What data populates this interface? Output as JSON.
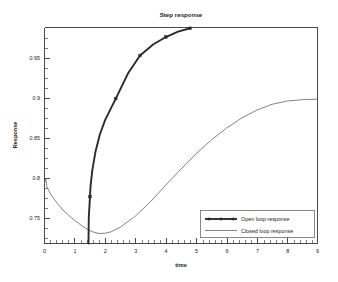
{
  "chart_data": {
    "type": "line",
    "title": "Step response",
    "xlabel": "time",
    "ylabel": "Response",
    "xlim": [
      0,
      9
    ],
    "ylim": [
      0.7194,
      0.9894
    ],
    "grid": false,
    "legend_position": "bottom-right",
    "x_ticks": [
      0,
      1,
      2,
      3,
      4,
      5,
      6,
      7,
      8,
      9
    ],
    "x_tick_labels": [
      "0",
      "1",
      "2",
      "3",
      "4",
      "5",
      "6",
      "7",
      "8",
      "9"
    ],
    "x_minor_tick_step": 0.2,
    "y_ticks": [
      0.75,
      0.8,
      0.85,
      0.9,
      0.95
    ],
    "y_tick_labels": [
      "0.75",
      "0.8",
      "0.85",
      "0.9",
      "0.95"
    ],
    "y_minor_tick_step": 0.0125,
    "series": [
      {
        "name": "Open loop response",
        "style": "line-with-square-markers",
        "color": "#2b2b2b",
        "markers": true,
        "x": [
          1.45,
          1.46,
          1.5,
          1.52,
          1.58,
          1.68,
          1.82,
          2.0,
          2.35,
          2.75,
          3.15,
          3.58,
          4.0,
          4.4,
          4.8
        ],
        "y": [
          0.7194,
          0.752,
          0.778,
          0.792,
          0.812,
          0.834,
          0.855,
          0.874,
          0.9005,
          0.9318,
          0.9545,
          0.9682,
          0.9775,
          0.9842,
          0.9885
        ],
        "marker_x": [
          1.5,
          2.35,
          3.15,
          4.0,
          4.8
        ],
        "marker_y": [
          0.778,
          0.9005,
          0.9545,
          0.9775,
          0.9885
        ]
      },
      {
        "name": "Closed loop response",
        "style": "thin-line",
        "color": "#6b6b6b",
        "markers": false,
        "x": [
          0.0,
          0.04,
          0.08,
          0.2,
          0.4,
          0.6,
          0.8,
          1.0,
          1.2,
          1.4,
          1.6,
          1.8,
          2.0,
          2.2,
          2.5,
          3.0,
          3.5,
          4.0,
          4.5,
          5.0,
          5.5,
          6.0,
          6.5,
          7.0,
          7.5,
          8.0,
          8.5,
          9.0
        ],
        "y": [
          0.7944,
          0.8005,
          0.7905,
          0.7812,
          0.7705,
          0.7616,
          0.7544,
          0.7482,
          0.7425,
          0.7375,
          0.7338,
          0.7319,
          0.7322,
          0.7341,
          0.7398,
          0.7538,
          0.7718,
          0.7925,
          0.8125,
          0.8316,
          0.8488,
          0.8636,
          0.8762,
          0.8862,
          0.8934,
          0.8975,
          0.8992,
          0.8998
        ]
      }
    ],
    "annotations": []
  },
  "legend": {
    "entries": [
      {
        "label": "Open loop response"
      },
      {
        "label": "Closed loop response"
      }
    ]
  }
}
